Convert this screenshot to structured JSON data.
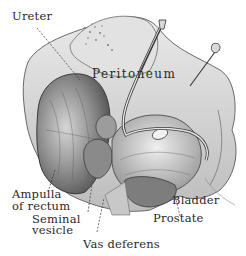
{
  "diagram": {
    "style": "grayscale pencil anatomical illustration",
    "colors": {
      "background": "#ffffff",
      "ink": "#2a2a2a",
      "shade_dark": "#6e6e6e",
      "shade_mid": "#a8a8a8",
      "shade_light": "#d9d9d9"
    },
    "labels": [
      {
        "id": "ureter",
        "text": "Ureter"
      },
      {
        "id": "peritoneum",
        "text": "Peritoneum"
      },
      {
        "id": "ampulla",
        "text": "Ampulla"
      },
      {
        "id": "of_rectum",
        "text": "of rectum"
      },
      {
        "id": "seminal",
        "text": "Seminal"
      },
      {
        "id": "vesicle",
        "text": "vesicle"
      },
      {
        "id": "vas_deferens",
        "text": "Vas deferens"
      },
      {
        "id": "bladder",
        "text": "Bladder"
      },
      {
        "id": "prostate",
        "text": "Prostate"
      }
    ]
  }
}
